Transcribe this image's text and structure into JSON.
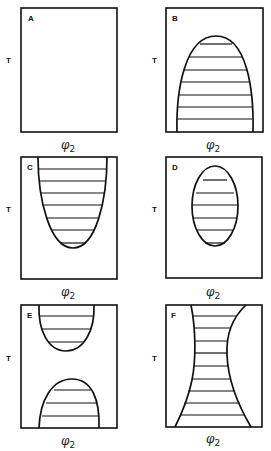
{
  "figure": {
    "panels": [
      {
        "id": "A",
        "label": "A",
        "y_axis": "T",
        "x_axis": "φ",
        "x_axis_sub": "2",
        "shape": "empty"
      },
      {
        "id": "B",
        "label": "B",
        "y_axis": "T",
        "x_axis": "φ",
        "x_axis_sub": "2",
        "shape": "dome-from-bottom"
      },
      {
        "id": "C",
        "label": "C",
        "y_axis": "T",
        "x_axis": "φ",
        "x_axis_sub": "2",
        "shape": "u-from-top"
      },
      {
        "id": "D",
        "label": "D",
        "y_axis": "T",
        "x_axis": "φ",
        "x_axis_sub": "2",
        "shape": "closed-loop"
      },
      {
        "id": "E",
        "label": "E",
        "y_axis": "T",
        "x_axis": "φ",
        "x_axis_sub": "2",
        "shape": "u-top-and-dome-bottom"
      },
      {
        "id": "F",
        "label": "F",
        "y_axis": "T",
        "x_axis": "φ",
        "x_axis_sub": "2",
        "shape": "hourglass"
      }
    ]
  }
}
